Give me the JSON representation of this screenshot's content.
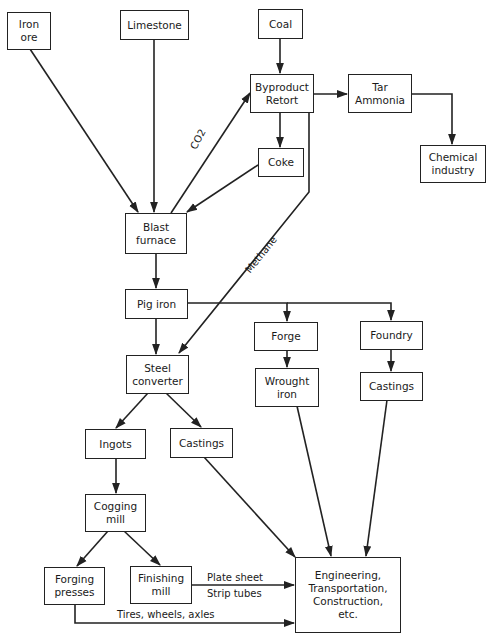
{
  "nodes": {
    "iron_ore": "Iron\nore",
    "limestone": "Limestone",
    "coal": "Coal",
    "byproduct_retort": "Byproduct\nRetort",
    "tar_ammonia": "Tar\nAmmonia",
    "chemical_industry": "Chemical\nindustry",
    "coke": "Coke",
    "blast_furnace": "Blast\nfurnace",
    "pig_iron": "Pig iron",
    "forge": "Forge",
    "foundry": "Foundry",
    "wrought_iron": "Wrought\niron",
    "castings_foundry": "Castings",
    "steel_converter": "Steel\nconverter",
    "ingots": "Ingots",
    "castings_converter": "Castings",
    "cogging_mill": "Cogging\nmill",
    "forging_presses": "Forging\npresses",
    "finishing_mill": "Finishing\nmill",
    "end_uses": "Engineering,\nTransportation,\nConstruction,\netc."
  },
  "edge_labels": {
    "co2": "CO2",
    "methane": "Methane",
    "plate_sheet": "Plate sheet",
    "strip_tubes": "Strip tubes",
    "tires_wheels_axles": "Tires, wheels, axles"
  },
  "edges": [
    {
      "from": "Iron ore",
      "to": "Blast furnace"
    },
    {
      "from": "Limestone",
      "to": "Blast furnace"
    },
    {
      "from": "Coal",
      "to": "Byproduct Retort"
    },
    {
      "from": "Blast furnace",
      "to": "Byproduct Retort",
      "label": "CO2"
    },
    {
      "from": "Byproduct Retort",
      "to": "Tar Ammonia"
    },
    {
      "from": "Tar Ammonia",
      "to": "Chemical industry"
    },
    {
      "from": "Byproduct Retort",
      "to": "Coke"
    },
    {
      "from": "Coke",
      "to": "Blast furnace"
    },
    {
      "from": "Byproduct Retort",
      "to": "Steel converter",
      "label": "Methane"
    },
    {
      "from": "Blast furnace",
      "to": "Pig iron"
    },
    {
      "from": "Pig iron",
      "to": "Steel converter"
    },
    {
      "from": "Pig iron",
      "to": "Forge"
    },
    {
      "from": "Pig iron",
      "to": "Foundry"
    },
    {
      "from": "Forge",
      "to": "Wrought iron"
    },
    {
      "from": "Foundry",
      "to": "Castings"
    },
    {
      "from": "Steel converter",
      "to": "Ingots"
    },
    {
      "from": "Steel converter",
      "to": "Castings"
    },
    {
      "from": "Ingots",
      "to": "Cogging mill"
    },
    {
      "from": "Cogging mill",
      "to": "Forging presses"
    },
    {
      "from": "Cogging mill",
      "to": "Finishing mill"
    },
    {
      "from": "Finishing mill",
      "to": "Engineering, Transportation, Construction, etc.",
      "label": "Plate sheet / Strip tubes"
    },
    {
      "from": "Forging presses",
      "to": "Engineering, Transportation, Construction, etc.",
      "label": "Tires, wheels, axles"
    },
    {
      "from": "Castings (converter)",
      "to": "Engineering, Transportation, Construction, etc."
    },
    {
      "from": "Wrought iron",
      "to": "Engineering, Transportation, Construction, etc."
    },
    {
      "from": "Castings (foundry)",
      "to": "Engineering, Transportation, Construction, etc."
    }
  ]
}
